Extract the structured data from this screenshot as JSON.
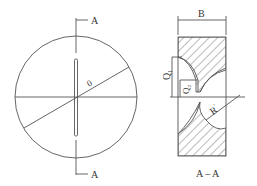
{
  "figure": {
    "type": "engineering-drawing",
    "stroke_color": "#555555",
    "front_view": {
      "section_label_top": "A",
      "section_label_bottom": "A",
      "angle_label": "0"
    },
    "section_view": {
      "width_label": "B",
      "dim_q1": "Q",
      "dim_q1_sub": "1",
      "dim_q2": "Q",
      "dim_q2_sub": "2",
      "radius_label": "R",
      "radius_sup": "'",
      "caption": "A – A"
    }
  }
}
